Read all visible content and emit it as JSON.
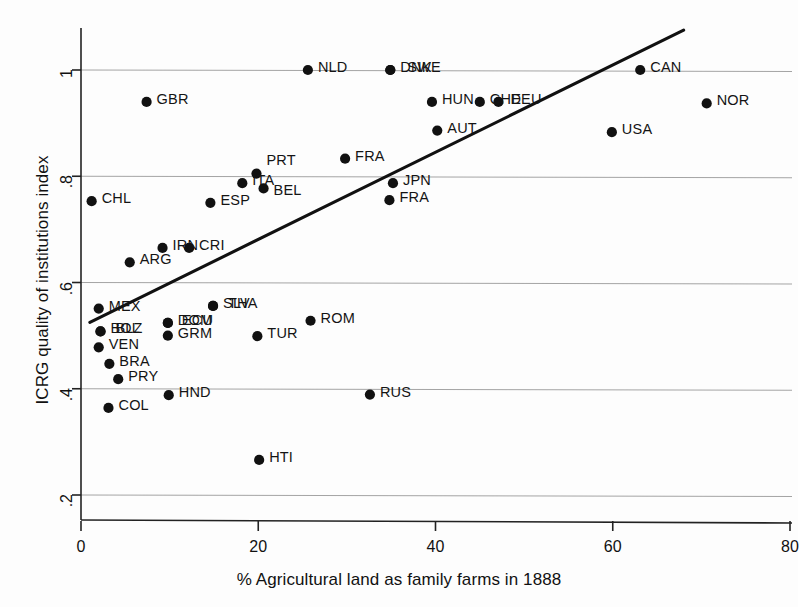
{
  "chart_data": {
    "type": "scatter",
    "title": "",
    "xlabel": "% Agricultural land as family farms in 1888",
    "ylabel": "ICRG quality of institutions index",
    "xlim": [
      -2,
      82
    ],
    "ylim": [
      0.155,
      1.09
    ],
    "xticks": [
      0,
      20,
      40,
      60,
      80
    ],
    "xtick_labels": [
      "0",
      "20",
      "40",
      "60",
      "80"
    ],
    "yticks": [
      0.2,
      0.4,
      0.6,
      0.8,
      1
    ],
    "ytick_labels": [
      ".2",
      ".4",
      ".6",
      ".8",
      "1"
    ],
    "grid": "horizontal",
    "legend": "none",
    "marker_color": "#111111",
    "line_color": "#111111",
    "grid_color": "#9a9a9a",
    "axis_color": "#222222",
    "fit_line": {
      "name": "linear fit",
      "x0": 1.0,
      "y0": 0.525,
      "x1": 68.0,
      "y1": 1.075
    },
    "points": [
      {
        "label": "CHL",
        "x": 1.2,
        "y": 0.753,
        "lx": 10,
        "ly": -2
      },
      {
        "label": "MEX",
        "x": 2.0,
        "y": 0.551,
        "lx": 10,
        "ly": -2
      },
      {
        "label": "BOL",
        "x": 2.2,
        "y": 0.508,
        "lx": 10,
        "ly": -2
      },
      {
        "label": "BLZ",
        "x": 2.2,
        "y": 0.508,
        "lx": 15,
        "ly": -2
      },
      {
        "label": "VEN",
        "x": 2.0,
        "y": 0.478,
        "lx": 10,
        "ly": -2
      },
      {
        "label": "BRA",
        "x": 3.2,
        "y": 0.447,
        "lx": 10,
        "ly": -2
      },
      {
        "label": "PRY",
        "x": 4.2,
        "y": 0.418,
        "lx": 10,
        "ly": -2
      },
      {
        "label": "COL",
        "x": 3.1,
        "y": 0.364,
        "lx": 10,
        "ly": -2
      },
      {
        "label": "ARG",
        "x": 5.5,
        "y": 0.638,
        "lx": 10,
        "ly": -2
      },
      {
        "label": "GBR",
        "x": 7.4,
        "y": 0.94,
        "lx": 10,
        "ly": -2
      },
      {
        "label": "IRN",
        "x": 9.2,
        "y": 0.665,
        "lx": 10,
        "ly": -2
      },
      {
        "label": "DOM",
        "x": 9.8,
        "y": 0.524,
        "lx": 10,
        "ly": -2
      },
      {
        "label": "ECU",
        "x": 9.8,
        "y": 0.524,
        "lx": 14,
        "ly": -2
      },
      {
        "label": "GRM",
        "x": 9.8,
        "y": 0.5,
        "lx": 10,
        "ly": -2
      },
      {
        "label": "HND",
        "x": 9.9,
        "y": 0.388,
        "lx": 10,
        "ly": -2
      },
      {
        "label": "CRI",
        "x": 12.2,
        "y": 0.665,
        "lx": 10,
        "ly": -2
      },
      {
        "label": "ESP",
        "x": 14.6,
        "y": 0.75,
        "lx": 10,
        "ly": -2
      },
      {
        "label": "SLV",
        "x": 14.9,
        "y": 0.556,
        "lx": 10,
        "ly": -2
      },
      {
        "label": "THA",
        "x": 14.9,
        "y": 0.556,
        "lx": 15,
        "ly": -2
      },
      {
        "label": "ITA",
        "x": 18.2,
        "y": 0.787,
        "lx": 10,
        "ly": -2
      },
      {
        "label": "PRT",
        "x": 19.8,
        "y": 0.805,
        "lx": 10,
        "ly": -13
      },
      {
        "label": "BEL",
        "x": 20.6,
        "y": 0.777,
        "lx": 10,
        "ly": 3
      },
      {
        "label": "TUR",
        "x": 19.9,
        "y": 0.499,
        "lx": 10,
        "ly": -2
      },
      {
        "label": "HTI",
        "x": 20.1,
        "y": 0.266,
        "lx": 10,
        "ly": -2
      },
      {
        "label": "ROM",
        "x": 25.9,
        "y": 0.528,
        "lx": 10,
        "ly": -2
      },
      {
        "label": "NLD",
        "x": 25.6,
        "y": 1.0,
        "lx": 10,
        "ly": -2
      },
      {
        "label": "FRA",
        "x": 29.8,
        "y": 0.833,
        "lx": 10,
        "ly": -2
      },
      {
        "label": "RUS",
        "x": 32.6,
        "y": 0.389,
        "lx": 10,
        "ly": -2
      },
      {
        "label": "JPN",
        "x": 35.2,
        "y": 0.787,
        "lx": 10,
        "ly": -2
      },
      {
        "label": "FRA",
        "x": 34.8,
        "y": 0.755,
        "lx": 10,
        "ly": -2
      },
      {
        "label": "DNK",
        "x": 34.9,
        "y": 1.0,
        "lx": 10,
        "ly": -2
      },
      {
        "label": "SWE",
        "x": 34.9,
        "y": 1.0,
        "lx": 17,
        "ly": -2
      },
      {
        "label": "HUN",
        "x": 39.6,
        "y": 0.94,
        "lx": 10,
        "ly": -2
      },
      {
        "label": "AUT",
        "x": 40.2,
        "y": 0.886,
        "lx": 10,
        "ly": -2
      },
      {
        "label": "CHE",
        "x": 45.0,
        "y": 0.94,
        "lx": 10,
        "ly": -2
      },
      {
        "label": "DEU",
        "x": 47.1,
        "y": 0.94,
        "lx": 12,
        "ly": -2
      },
      {
        "label": "USA",
        "x": 59.9,
        "y": 0.883,
        "lx": 10,
        "ly": -2
      },
      {
        "label": "CAN",
        "x": 63.1,
        "y": 1.0,
        "lx": 10,
        "ly": -2
      },
      {
        "label": "NOR",
        "x": 70.6,
        "y": 0.937,
        "lx": 10,
        "ly": -2
      }
    ]
  }
}
